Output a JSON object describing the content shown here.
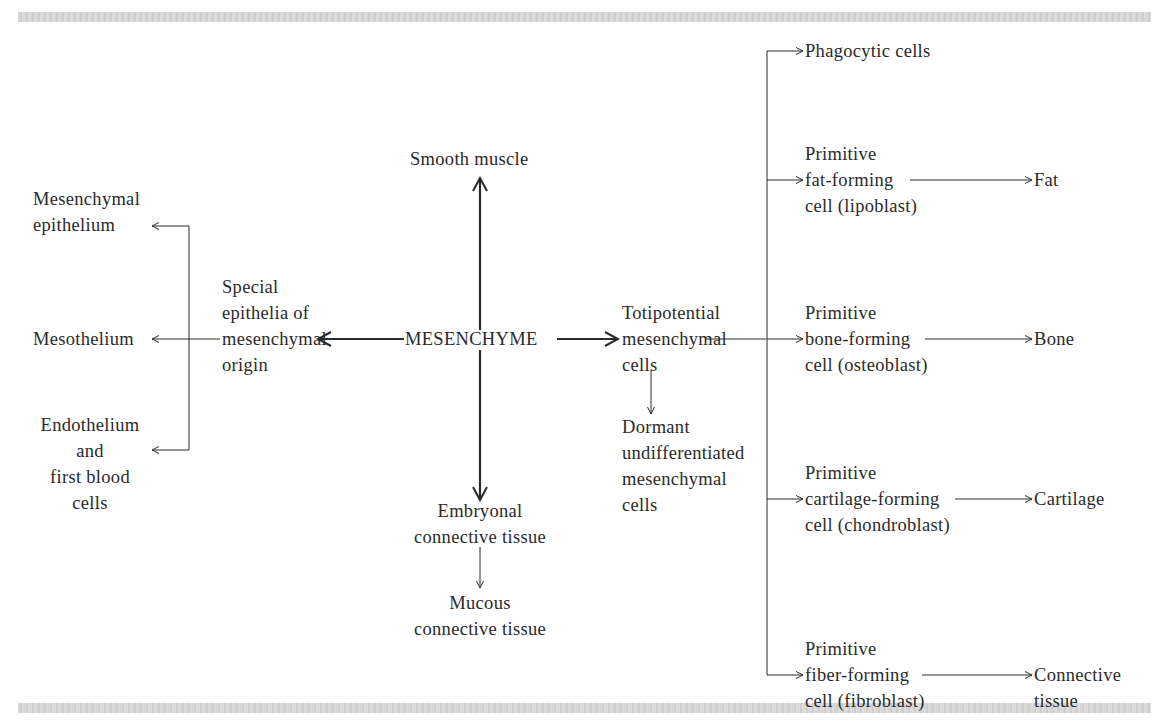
{
  "center": {
    "label": "MESENCHYME"
  },
  "up": {
    "label": "Smooth muscle"
  },
  "down": {
    "label": "Embryonal\nconnective tissue",
    "child": "Mucous\nconnective tissue"
  },
  "left": {
    "label": "Special\nepithelia of\nmesenchymal\norigin",
    "children": [
      "Mesenchymal\nepithelium",
      "Mesothelium",
      "Endothelium\nand\nfirst blood\ncells"
    ]
  },
  "right": {
    "label": "Totipotential\nmesenchymal\ncells",
    "dormant": "Dormant\nundifferentiated\nmesenchymal\ncells",
    "branches": [
      {
        "cell": "Phagocytic cells",
        "product": ""
      },
      {
        "cell": "Primitive\nfat-forming\ncell (lipoblast)",
        "product": "Fat"
      },
      {
        "cell": "Primitive\nbone-forming\ncell (osteoblast)",
        "product": "Bone"
      },
      {
        "cell": "Primitive\ncartilage-forming\ncell (chondroblast)",
        "product": "Cartilage"
      },
      {
        "cell": "Primitive\nfiber-forming\ncell (fibroblast)",
        "product": "Connective\ntissue"
      }
    ]
  },
  "colors": {
    "ink": "#2a2a2a",
    "rule": "#d4d4d4",
    "background": "#ffffff"
  }
}
